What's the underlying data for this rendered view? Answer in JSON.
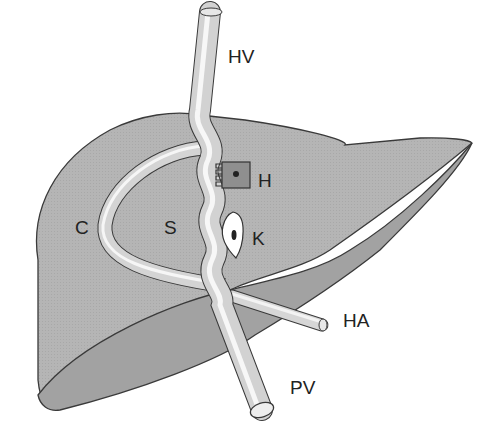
{
  "diagram": {
    "colors": {
      "liver_fill": "#b3b3b3",
      "liver_shadow": "#a3a3a3",
      "outline": "#3a3a3a",
      "vessel": "#d8d8d8",
      "vessel_highlight": "#f6f6f6",
      "hepatocyte": "#8c8c8c",
      "kupffer": "#ffffff",
      "nucleus": "#222222"
    },
    "labels": {
      "hv": "HV",
      "h": "H",
      "c": "C",
      "s": "S",
      "k": "K",
      "ha": "HA",
      "pv": "PV"
    }
  }
}
